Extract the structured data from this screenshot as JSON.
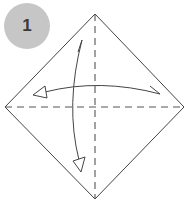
{
  "step": {
    "number": "1",
    "badge_color": "#c6c6c6",
    "number_color": "#3a3a3a"
  },
  "diagram": {
    "shape": "diamond",
    "line_color": "#444444",
    "vertices": {
      "top": [
        95,
        14
      ],
      "right": [
        184,
        107
      ],
      "bottom": [
        95,
        199
      ],
      "left": [
        5,
        107
      ]
    },
    "crease_lines": [
      {
        "type": "valley-fold-dashed",
        "orientation": "vertical",
        "from": [
          95,
          14
        ],
        "to": [
          95,
          199
        ]
      },
      {
        "type": "valley-fold-dashed",
        "orientation": "horizontal",
        "from": [
          5,
          107
        ],
        "to": [
          184,
          107
        ]
      }
    ],
    "arrows": [
      {
        "name": "fold-and-unfold-horizontal",
        "from": [
          160,
          94
        ],
        "to": [
          33,
          94
        ],
        "curve": "arched-up"
      },
      {
        "name": "fold-and-unfold-vertical",
        "from": [
          82,
          40
        ],
        "to": [
          81,
          171
        ],
        "curve": "arched-left"
      }
    ]
  }
}
